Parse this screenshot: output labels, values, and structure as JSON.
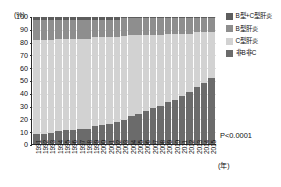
{
  "chart_data": {
    "type": "bar",
    "title": "",
    "subtitle": "",
    "stacked": true,
    "stack_mode": "percent",
    "xlabel": "(年)",
    "ylabel": "(%)",
    "ylim": [
      0,
      100
    ],
    "ytick_step": 10,
    "grid": true,
    "legend_position": "right",
    "categories": [
      "1991",
      "1992",
      "1993",
      "1994",
      "1995",
      "1996",
      "1997",
      "1998",
      "1999",
      "2000",
      "2001",
      "2002",
      "2003",
      "2004",
      "2005",
      "2006",
      "2007",
      "2008",
      "2009",
      "2010",
      "2011",
      "2012",
      "2013",
      "2014",
      "2015"
    ],
    "ytick_labels": [
      "0",
      "10",
      "20",
      "30",
      "40",
      "50",
      "60",
      "70",
      "80",
      "90",
      "100"
    ],
    "series": [
      {
        "name": "B型+C型肝炎",
        "color": "#5d5d5d",
        "values": [
          2,
          2,
          2,
          2,
          2,
          2,
          2,
          2,
          2,
          2,
          2,
          2,
          1,
          1,
          1,
          1,
          1,
          1,
          1,
          1,
          1,
          1,
          1,
          1,
          1
        ]
      },
      {
        "name": "B型肝炎",
        "color": "#8e8e8e",
        "values": [
          16,
          16,
          16,
          15,
          15,
          15,
          15,
          15,
          14,
          14,
          14,
          14,
          14,
          13,
          13,
          13,
          13,
          13,
          12,
          12,
          12,
          12,
          11,
          11,
          11
        ]
      },
      {
        "name": "C型肝炎",
        "color": "#d2d2d2",
        "values": [
          74,
          74,
          73,
          73,
          72,
          72,
          71,
          71,
          70,
          69,
          68,
          67,
          66,
          64,
          62,
          60,
          58,
          56,
          54,
          52,
          49,
          46,
          43,
          40,
          36
        ]
      },
      {
        "name": "非B非C",
        "color": "#6b6b6b",
        "values": [
          8,
          8,
          9,
          10,
          11,
          11,
          12,
          12,
          14,
          15,
          16,
          17,
          19,
          22,
          24,
          26,
          28,
          30,
          33,
          35,
          38,
          41,
          45,
          48,
          52
        ]
      }
    ],
    "annotation": "P<0.0001"
  },
  "legend": {
    "items": [
      {
        "label": "B型+C型肝炎"
      },
      {
        "label": "B型肝炎"
      },
      {
        "label": "C型肝炎"
      },
      {
        "label": "非B非C"
      }
    ]
  },
  "axes": {
    "y_unit": "(%)",
    "x_unit": "(年)"
  },
  "annotation": {
    "pvalue": "P<0.0001"
  }
}
